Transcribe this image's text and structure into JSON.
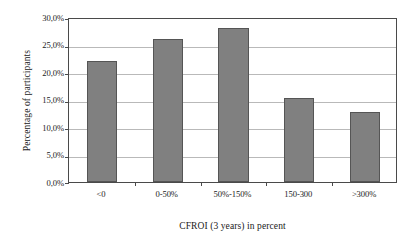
{
  "chart_data": {
    "type": "bar",
    "title": "",
    "subtitle": "",
    "categories": [
      "<0",
      "0-50%",
      "50%-150%",
      "150-300",
      ">300%"
    ],
    "values": [
      22.0,
      26.0,
      28.0,
      15.2,
      12.8
    ],
    "xlabel": "CFROI (3 years) in percent",
    "ylabel": "Percentage of participants",
    "ylim": [
      0,
      30
    ],
    "ytick_values": [
      0,
      5,
      10,
      15,
      20,
      25,
      30
    ],
    "ytick_labels": [
      "0,0%",
      "5,0%",
      "10,0%",
      "15,0%",
      "20,0%",
      "25,0%",
      "30,0%"
    ],
    "grid": true,
    "grid_axis": "y",
    "legend": false,
    "legend_position": "none",
    "bar_color": "#808080",
    "bar_border_color": "#555555",
    "gridline_color": "#b9b9b9",
    "axis_color": "#4a4a4a",
    "plot_background": "#ffffff",
    "figure_background": "#ffffff"
  }
}
